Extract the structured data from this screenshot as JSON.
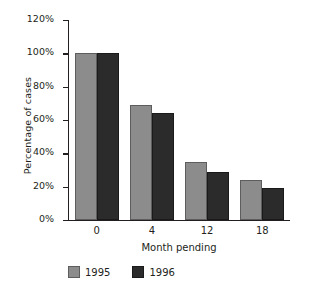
{
  "chart_data": {
    "type": "bar",
    "title": "",
    "xlabel": "Month pending",
    "ylabel": "Percentage of cases",
    "categories": [
      "0",
      "4",
      "12",
      "18"
    ],
    "series": [
      {
        "name": "1995",
        "color": "#8c8c8c",
        "values": [
          100,
          69,
          35,
          24
        ]
      },
      {
        "name": "1996",
        "color": "#2b2b2b",
        "values": [
          100,
          64,
          29,
          19
        ]
      }
    ],
    "ylim": [
      0,
      120
    ],
    "yticks": [
      0,
      20,
      40,
      60,
      80,
      100,
      120
    ],
    "ytick_labels": [
      "0%",
      "20%",
      "40%",
      "60%",
      "80%",
      "100%",
      "120%"
    ],
    "grid": false,
    "legend_position": "bottom-left",
    "value_unit": "%"
  },
  "legend": {
    "items": [
      {
        "label": "1995"
      },
      {
        "label": "1996"
      }
    ]
  }
}
